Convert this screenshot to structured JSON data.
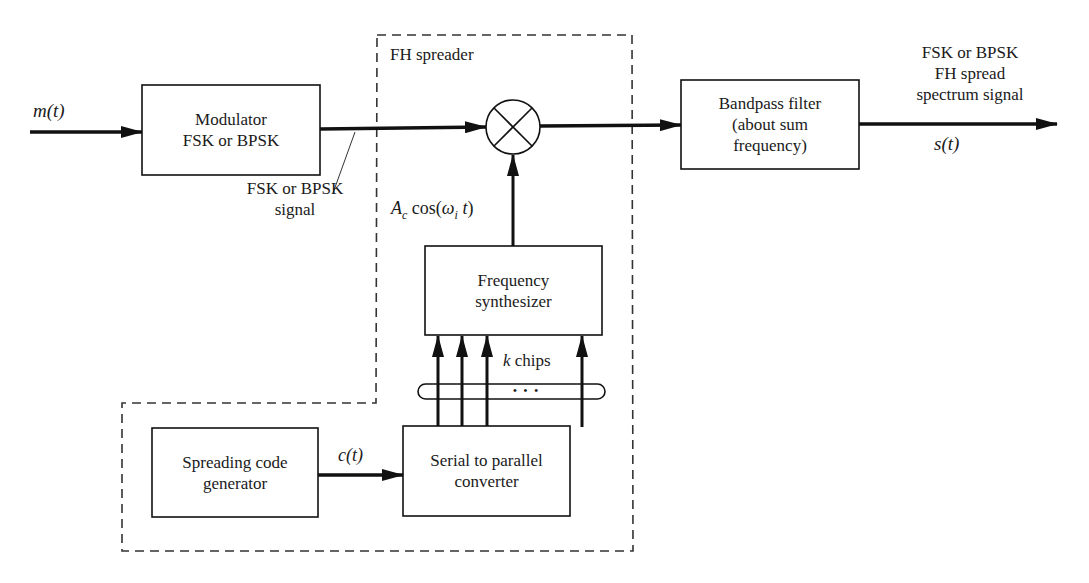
{
  "diagram": {
    "input_signal": "m(t)",
    "blocks": {
      "modulator": [
        "Modulator",
        "FSK or BPSK"
      ],
      "bandpass_filter": [
        "Bandpass filter",
        "(about sum",
        "frequency)"
      ],
      "frequency_synthesizer": [
        "Frequency",
        "synthesizer"
      ],
      "serial_to_parallel": [
        "Serial to parallel",
        "converter"
      ],
      "spreading_code_generator": [
        "Spreading code",
        "generator"
      ]
    },
    "group_label": "FH spreader",
    "mixer_symbol": "multiplier",
    "labels": {
      "modulator_output": [
        "FSK or BPSK",
        "signal"
      ],
      "carrier": "A_c cos(ω_i t)",
      "carrier_parts": {
        "a": "A",
        "sub_c": "c",
        "cos": " cos(",
        "omega": "ω",
        "sub_i": "i",
        "t": " t",
        "close": ")"
      },
      "code_signal": "c(t)",
      "bus": "k chips",
      "bus_k": "k",
      "bus_rest": " chips",
      "bus_ellipsis": "• • •",
      "output_title": [
        "FSK or BPSK",
        "FH spread",
        "spectrum signal"
      ],
      "output_signal": "s(t)"
    },
    "colors": {
      "line": "#111111",
      "dashed": "#333333",
      "background": "#ffffff"
    }
  }
}
